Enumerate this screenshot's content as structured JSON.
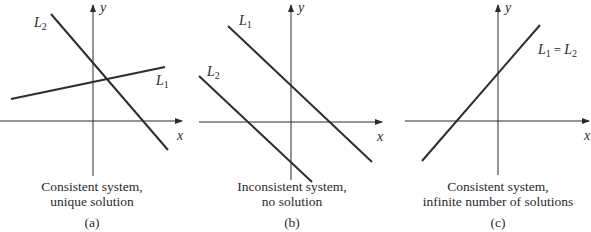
{
  "figure": {
    "panels": [
      {
        "id": "a",
        "tag": "(a)",
        "caption_line1": "Consistent system,",
        "caption_line2": "unique solution",
        "axis_x_label": "x",
        "axis_y_label": "y",
        "lines": [
          {
            "name": "L",
            "sub": "1"
          },
          {
            "name": "L",
            "sub": "2"
          }
        ]
      },
      {
        "id": "b",
        "tag": "(b)",
        "caption_line1": "Inconsistent system,",
        "caption_line2": "no solution",
        "axis_x_label": "x",
        "axis_y_label": "y",
        "lines": [
          {
            "name": "L",
            "sub": "1"
          },
          {
            "name": "L",
            "sub": "2"
          }
        ]
      },
      {
        "id": "c",
        "tag": "(c)",
        "caption_line1": "Consistent system,",
        "caption_line2": "infinite number of solutions",
        "axis_x_label": "x",
        "axis_y_label": "y",
        "lines": [
          {
            "name": "L",
            "sub": "1",
            "eq": "=",
            "name2": "L",
            "sub2": "2"
          }
        ]
      }
    ],
    "colors": {
      "line": "#2e2e2e",
      "axis": "#2a2a2a",
      "background": "#ffffff"
    }
  }
}
